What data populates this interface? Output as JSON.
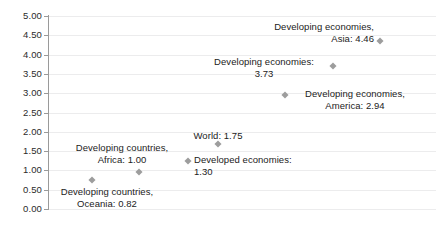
{
  "chart_data": {
    "type": "scatter",
    "title": "",
    "xlabel": "",
    "ylabel": "",
    "ylim": [
      0.0,
      5.0
    ],
    "ytick_step": 0.5,
    "grid": true,
    "legend": "none",
    "x_axis_visible": false,
    "marker_shape": "diamond",
    "marker_color": "#9d9d9d",
    "gridline_color": "#ececed",
    "axis_color": "#9a9a9a",
    "text_color": "#222222",
    "y_ticks": [
      "5.00",
      "4.50",
      "4.00",
      "3.50",
      "3.00",
      "2.50",
      "2.00",
      "1.50",
      "1.00",
      "0.50",
      "0.00"
    ],
    "points": [
      {
        "name": "Developing countries, Oceania",
        "label": "Developing countries,\nOceania: 0.82",
        "value": 0.82,
        "x_px": 92,
        "y_px": 180,
        "label_left_px": 46,
        "label_top_px": 186,
        "label_width_px": 122,
        "label_align": "center"
      },
      {
        "name": "Developing countries, Africa",
        "label": "Developing countries,\nAfrica: 1.00",
        "value": 1.0,
        "x_px": 139,
        "y_px": 172,
        "label_left_px": 61,
        "label_top_px": 142,
        "label_width_px": 122,
        "label_align": "center"
      },
      {
        "name": "Developed economies",
        "label": "Developed economies:\n1.30",
        "value": 1.3,
        "x_px": 188,
        "y_px": 161,
        "label_left_px": 194,
        "label_top_px": 154,
        "label_width_px": 118,
        "label_align": "left"
      },
      {
        "name": "World",
        "label": "World: 1.75",
        "value": 1.75,
        "x_px": 218,
        "y_px": 144,
        "label_left_px": 183,
        "label_top_px": 130,
        "label_width_px": 70,
        "label_align": "center"
      },
      {
        "name": "Developing economies, America",
        "label": "Developing economies,\nAmerica: 2.94",
        "value": 2.94,
        "x_px": 285,
        "y_px": 95,
        "label_left_px": 292,
        "label_top_px": 88,
        "label_width_px": 126,
        "label_align": "center"
      },
      {
        "name": "Developing economies",
        "label": "Developing economies:\n3.73",
        "value": 3.73,
        "x_px": 333,
        "y_px": 66,
        "label_left_px": 202,
        "label_top_px": 56,
        "label_width_px": 124,
        "label_align": "center"
      },
      {
        "name": "Developing economies, Asia",
        "label": "Developing economies,\nAsia: 4.46",
        "value": 4.46,
        "x_px": 380,
        "y_px": 41,
        "label_left_px": 248,
        "label_top_px": 21,
        "label_width_px": 126,
        "label_align": "right"
      }
    ]
  }
}
